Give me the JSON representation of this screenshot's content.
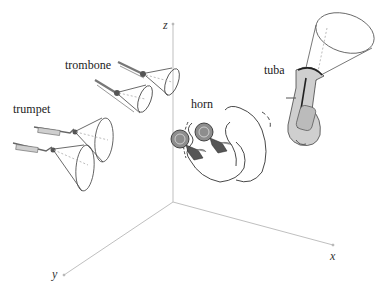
{
  "diagram": {
    "type": "3d-axes-instrument-radiation",
    "axes": {
      "x": {
        "label": "x"
      },
      "y": {
        "label": "y"
      },
      "z": {
        "label": "z"
      }
    },
    "instruments": [
      {
        "name": "trumpet",
        "label": "trumpet",
        "count": 2,
        "radiation": "narrow cone"
      },
      {
        "name": "trombone",
        "label": "trombone",
        "count": 2,
        "radiation": "narrow cone"
      },
      {
        "name": "horn",
        "label": "horn",
        "count": 2,
        "radiation": "wide backward lobe"
      },
      {
        "name": "tuba",
        "label": "tuba",
        "count": 1,
        "radiation": "upward cone"
      }
    ]
  },
  "colors": {
    "background": "#ffffff",
    "axis": "#b5b5b5",
    "outline": "#333333",
    "brass": "#9a9a9a"
  }
}
